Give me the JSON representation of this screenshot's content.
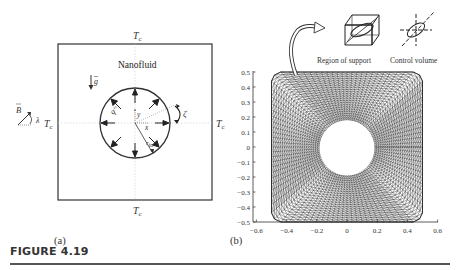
{
  "figure": {
    "caption": "FIGURE 4.19",
    "panel_a_label": "(a)",
    "panel_b_label": "(b)"
  },
  "panel_a": {
    "medium_label": "Nanofluid",
    "temp_top": "Tc",
    "temp_bottom": "Tc",
    "temp_left": "Tc",
    "temp_right": "Tc",
    "gravity_label": "g",
    "magnetic_label": "B",
    "angle_label": "λ",
    "heat_flux_label": "q''",
    "rotation_label": "ζ",
    "x_label": "x",
    "y_label": "y",
    "radius_label": "r_in"
  },
  "panel_b": {
    "inset_left_label": "Region of support",
    "inset_right_label": "Control volume",
    "x_ticks": [
      "−0.6",
      "−0.4",
      "−0.2",
      "0",
      "0.2",
      "0.4",
      "0.6"
    ],
    "y_ticks": [
      "0.5",
      "0.4",
      "0.3",
      "0.2",
      "0.1",
      "0",
      "−0.1",
      "−0.2",
      "−0.3",
      "−0.4",
      "−0.5"
    ],
    "mesh": {
      "outer_half_width": 0.5,
      "inner_radius": 0.18,
      "radial_lines": 48,
      "rings": 22,
      "color": "#333333"
    }
  }
}
